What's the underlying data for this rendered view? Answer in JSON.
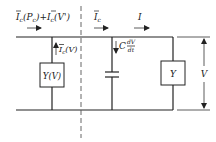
{
  "diagram": {
    "type": "circuit",
    "labels": {
      "left_current_main": "I",
      "left_current_sub1": "c",
      "left_current_arg1": "(P",
      "left_current_arg1_sub": "c",
      "left_current_arg1_close": ")",
      "left_plus": "+",
      "left_current2_main": "I",
      "left_current2_sub": "c",
      "left_current2_arg": "(V')",
      "mid_current_main": "I",
      "mid_current_sub": "c",
      "right_current": "I",
      "branch_current_main": "I",
      "branch_current_sub": "c",
      "branch_current_arg": "(V)",
      "cap_C": "C",
      "cap_num": "dV",
      "cap_den": "dt",
      "nonlinear_admittance": "Y(V)",
      "load_admittance": "Y",
      "voltage": "V"
    },
    "components": [
      {
        "name": "nonlinear-admittance",
        "label": "Y(V)"
      },
      {
        "name": "capacitor",
        "label": "C dV/dt"
      },
      {
        "name": "load-admittance",
        "label": "Y"
      }
    ],
    "colors": {
      "line": "#222222",
      "background": "#ffffff"
    }
  }
}
